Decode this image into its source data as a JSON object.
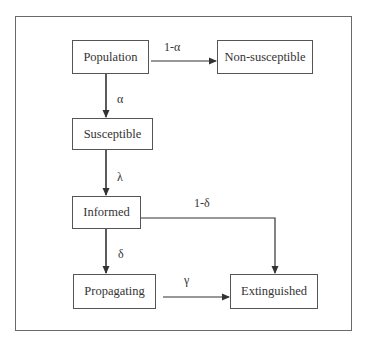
{
  "diagram": {
    "nodes": [
      {
        "id": "population",
        "label": "Population"
      },
      {
        "id": "non_susceptible",
        "label": "Non-susceptible"
      },
      {
        "id": "susceptible",
        "label": "Susceptible"
      },
      {
        "id": "informed",
        "label": "Informed"
      },
      {
        "id": "propagating",
        "label": "Propagating"
      },
      {
        "id": "extinguished",
        "label": "Extinguished"
      }
    ],
    "edges": [
      {
        "from": "population",
        "to": "non_susceptible",
        "label": "1-α"
      },
      {
        "from": "population",
        "to": "susceptible",
        "label": "α"
      },
      {
        "from": "susceptible",
        "to": "informed",
        "label": "λ"
      },
      {
        "from": "informed",
        "to": "extinguished",
        "label": "1-δ"
      },
      {
        "from": "informed",
        "to": "propagating",
        "label": "δ"
      },
      {
        "from": "propagating",
        "to": "extinguished",
        "label": "γ"
      }
    ]
  }
}
